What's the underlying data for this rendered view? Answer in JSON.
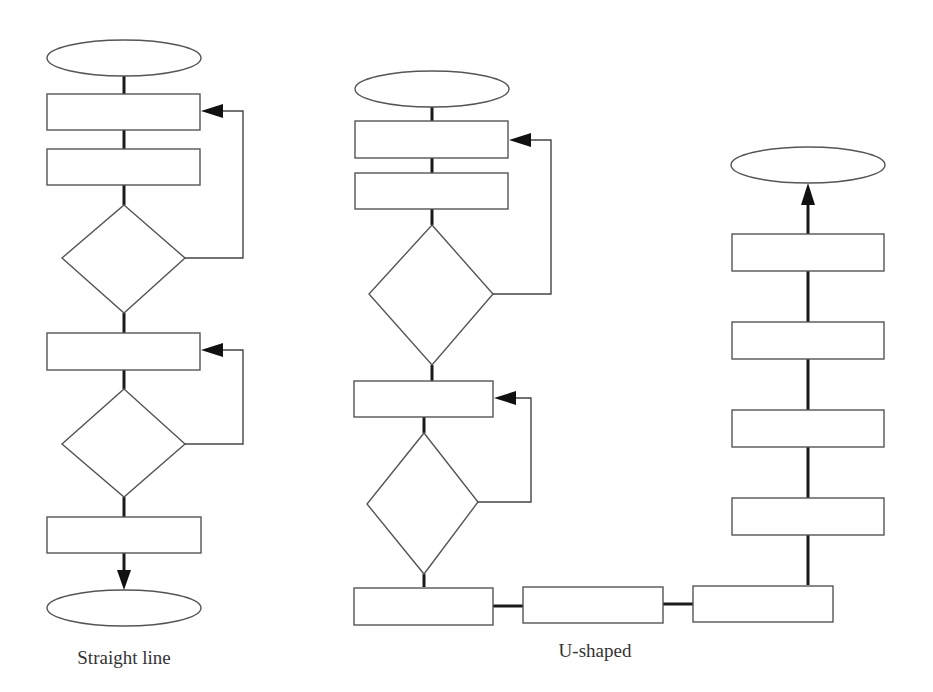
{
  "figure": {
    "type": "flowchart-comparison",
    "colors": {
      "stroke": "#555555",
      "connector": "#1a1a1a",
      "background": "#ffffff",
      "text": "#333333"
    }
  },
  "flowcharts": [
    {
      "caption": "Straight line",
      "shapes": [
        "terminator",
        "process",
        "process",
        "decision",
        "process",
        "decision",
        "process",
        "terminator"
      ],
      "loops": 2
    },
    {
      "caption": "U-shaped",
      "shapes": [
        "terminator",
        "process",
        "process",
        "decision",
        "process",
        "decision",
        "process",
        "process",
        "process",
        "process",
        "process",
        "process",
        "process",
        "terminator"
      ],
      "loops": 2
    }
  ]
}
